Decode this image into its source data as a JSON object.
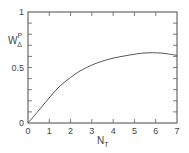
{
  "chart_data": {
    "type": "line",
    "title": "",
    "xlabel": "N",
    "xlabel_sub": "T",
    "ylabel": "W",
    "ylabel_sub": "Δ",
    "ylabel_sup": "P",
    "xlim": [
      0,
      7
    ],
    "ylim": [
      0,
      1
    ],
    "x_ticks": [
      0,
      1,
      2,
      3,
      4,
      5,
      6,
      7
    ],
    "x_tick_labels": [
      "0",
      "1",
      "2",
      "3",
      "4",
      "5",
      "6",
      "7"
    ],
    "y_minor_ticks": [
      0.1,
      0.2,
      0.3,
      0.4,
      0.5,
      0.6,
      0.7,
      0.8,
      0.9
    ],
    "y_tick_labels": [
      {
        "value": 0,
        "label": "0"
      },
      {
        "value": 0.5,
        "label": "0.5"
      },
      {
        "value": 1,
        "label": "1"
      }
    ],
    "grid": false,
    "legend": "none",
    "series": [
      {
        "name": "W_Δ^P",
        "x": [
          0,
          0.56,
          1.03,
          1.5,
          2.0,
          2.44,
          3.1,
          3.85,
          4.79,
          5.5,
          6.2,
          6.9
        ],
        "y": [
          0,
          0.126,
          0.234,
          0.333,
          0.41,
          0.468,
          0.53,
          0.577,
          0.613,
          0.631,
          0.631,
          0.613
        ]
      }
    ]
  }
}
